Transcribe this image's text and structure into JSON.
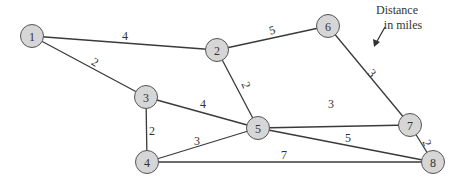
{
  "annotation": {
    "line1": "Distance",
    "line2": "in miles"
  },
  "nodes": [
    {
      "id": "1",
      "label": "1",
      "x": 32,
      "y": 36
    },
    {
      "id": "2",
      "label": "2",
      "x": 217,
      "y": 50
    },
    {
      "id": "3",
      "label": "3",
      "x": 146,
      "y": 97
    },
    {
      "id": "4",
      "label": "4",
      "x": 147,
      "y": 162
    },
    {
      "id": "5",
      "label": "5",
      "x": 258,
      "y": 128
    },
    {
      "id": "6",
      "label": "6",
      "x": 328,
      "y": 26
    },
    {
      "id": "7",
      "label": "7",
      "x": 410,
      "y": 125
    },
    {
      "id": "8",
      "label": "8",
      "x": 433,
      "y": 162
    }
  ],
  "edges": [
    {
      "from": "1",
      "to": "2",
      "weight": "4",
      "lx": 125,
      "ly": 36,
      "rot": 0
    },
    {
      "from": "1",
      "to": "3",
      "weight": "2",
      "lx": 95,
      "ly": 62,
      "rot": 30
    },
    {
      "from": "2",
      "to": "6",
      "weight": "5",
      "lx": 272,
      "ly": 30,
      "rot": -15
    },
    {
      "from": "2",
      "to": "5",
      "weight": "2",
      "lx": 246,
      "ly": 85,
      "rot": 68
    },
    {
      "from": "6",
      "to": "7",
      "weight": "3",
      "lx": 372,
      "ly": 73,
      "rot": 48
    },
    {
      "from": "3",
      "to": "4",
      "weight": "2",
      "lx": 152,
      "ly": 131,
      "rot": 0
    },
    {
      "from": "3",
      "to": "5",
      "weight": "4",
      "lx": 203,
      "ly": 104,
      "rot": 0
    },
    {
      "from": "4",
      "to": "5",
      "weight": "3",
      "lx": 197,
      "ly": 141,
      "rot": 0
    },
    {
      "from": "5",
      "to": "7",
      "weight": "3",
      "lx": 331,
      "ly": 104,
      "rot": 0
    },
    {
      "from": "5",
      "to": "8",
      "weight": "5",
      "lx": 348,
      "ly": 138,
      "rot": 0
    },
    {
      "from": "4",
      "to": "8",
      "weight": "7",
      "lx": 284,
      "ly": 155,
      "rot": 0
    },
    {
      "from": "7",
      "to": "8",
      "weight": "2",
      "lx": 427,
      "ly": 143,
      "rot": 70
    }
  ]
}
